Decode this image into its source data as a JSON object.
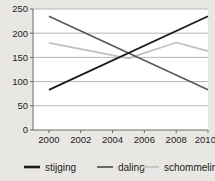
{
  "chart_data": {
    "type": "line",
    "title": "",
    "xlabel": "",
    "ylabel": "",
    "ylim": [
      0,
      250
    ],
    "xlim": [
      1999,
      2010
    ],
    "grid": true,
    "legend_position": "bottom",
    "yticks": [
      0,
      50,
      100,
      150,
      200,
      250
    ],
    "ytick_labels": [
      "0",
      "50",
      "100",
      "150",
      "200",
      "250"
    ],
    "xticks": [
      2000,
      2002,
      2004,
      2006,
      2008,
      2010
    ],
    "xtick_labels": [
      "2000",
      "2002",
      "2004",
      "2006",
      "2008",
      "2010?"
    ],
    "series": [
      {
        "name": "stijging",
        "color": "#1b1b1b",
        "width": 1.9,
        "x": [
          2000,
          2010
        ],
        "values": [
          83,
          235
        ]
      },
      {
        "name": "daling",
        "color": "#5a5856",
        "width": 1.6,
        "x": [
          2000,
          2010
        ],
        "values": [
          235,
          83
        ]
      },
      {
        "name": "schommeling",
        "color": "#c2c0bd",
        "width": 1.6,
        "x": [
          2000,
          2005,
          2008,
          2010
        ],
        "values": [
          180,
          148,
          181,
          163
        ]
      }
    ]
  },
  "legend": {
    "items": [
      {
        "label": "stijging",
        "color": "#1b1b1b",
        "width": 2.6
      },
      {
        "label": "daling",
        "color": "#6b6966",
        "width": 2.0
      },
      {
        "label": "schommeling",
        "color": "#c9c7c4",
        "width": 2.0
      }
    ]
  }
}
